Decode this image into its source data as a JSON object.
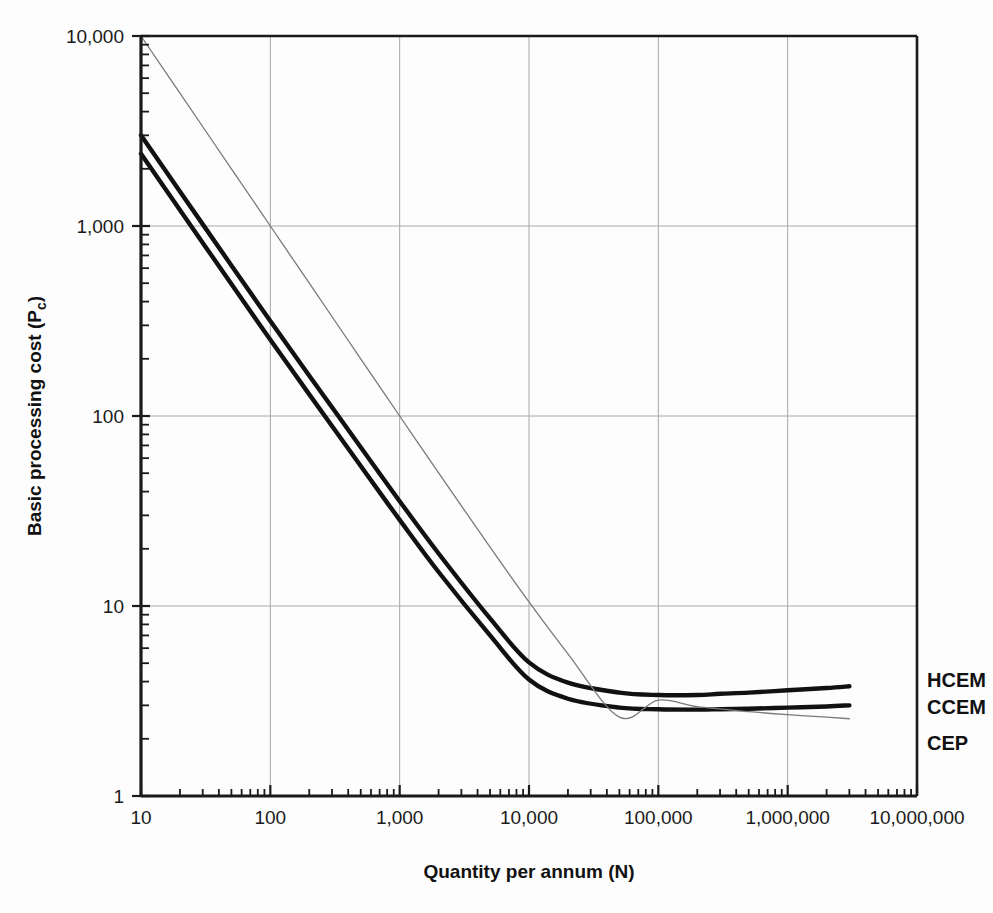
{
  "chart_data": {
    "type": "line",
    "title": "",
    "subtitle": "",
    "xlabel": "Quantity per annum (N)",
    "ylabel": "Basic processing cost (P",
    "ylabel_sub": "c",
    "ylabel_suffix": ")",
    "xscale": "log",
    "yscale": "log",
    "xlim": [
      10,
      10000000
    ],
    "ylim": [
      1,
      10000
    ],
    "grid": true,
    "legend_position": "right-of-plot-inline",
    "xticks": [
      10,
      100,
      1000,
      10000,
      100000,
      1000000,
      10000000
    ],
    "xticklabels": [
      "10",
      "100",
      "1,000",
      "10,000",
      "100,000",
      "1,000,000",
      "10,000,000"
    ],
    "yticks": [
      1,
      10,
      100,
      1000,
      10000
    ],
    "yticklabels": [
      "1",
      "10",
      "100",
      "1,000",
      "10,000"
    ],
    "series": [
      {
        "name": "HCEM",
        "label": "HCEM",
        "style": "thick",
        "color": "#111111",
        "x": [
          10,
          20,
          50,
          100,
          200,
          500,
          1000,
          2000,
          5000,
          10000,
          20000,
          50000,
          100000,
          200000,
          300000,
          500000,
          1000000,
          2000000,
          3000000
        ],
        "y": [
          3000,
          1520,
          620,
          316,
          163,
          68.5,
          35.6,
          18.9,
          8.6,
          5.05,
          3.95,
          3.5,
          3.4,
          3.4,
          3.45,
          3.5,
          3.6,
          3.7,
          3.78
        ]
      },
      {
        "name": "CCEM",
        "label": "CCEM",
        "style": "thick",
        "color": "#111111",
        "x": [
          10,
          20,
          50,
          100,
          200,
          500,
          1000,
          2000,
          5000,
          10000,
          20000,
          50000,
          100000,
          200000,
          300000,
          500000,
          1000000,
          2000000,
          3000000
        ],
        "y": [
          2400,
          1215,
          495,
          252,
          130,
          54.5,
          28.4,
          15.1,
          7.0,
          4.1,
          3.25,
          2.92,
          2.86,
          2.85,
          2.86,
          2.88,
          2.92,
          2.96,
          3.0
        ]
      },
      {
        "name": "CEP",
        "label": "CEP",
        "style": "thin",
        "color": "#7a7a7a",
        "x": [
          10,
          20,
          50,
          100,
          200,
          500,
          1000,
          2000,
          5000,
          10000,
          20000,
          50000,
          100000,
          200000,
          500000,
          1000000,
          2000000,
          3000000
        ],
        "y": [
          10000,
          5000,
          2000,
          1000,
          500,
          200,
          100,
          50.2,
          20.4,
          10.5,
          5.6,
          2.6,
          3.2,
          2.95,
          2.78,
          2.68,
          2.6,
          2.55
        ]
      }
    ],
    "annotations": [
      {
        "text": "HCEM",
        "anchor_x": 3000000,
        "anchor_y": 3.78
      },
      {
        "text": "CCEM",
        "anchor_x": 3000000,
        "anchor_y": 3.0
      },
      {
        "text": "CEP",
        "anchor_x": 3000000,
        "anchor_y": 2.55
      }
    ]
  },
  "axes": {
    "x_title": "Quantity per annum (N)",
    "y_title_main": "Basic processing cost (P",
    "y_title_sub": "c",
    "y_title_end": ")"
  },
  "colors": {
    "curve": "#111111",
    "curve_thin": "#7a7a7a",
    "grid": "#a8a8a8",
    "axis": "#1a1a1a",
    "background": "#fdfdfd"
  }
}
